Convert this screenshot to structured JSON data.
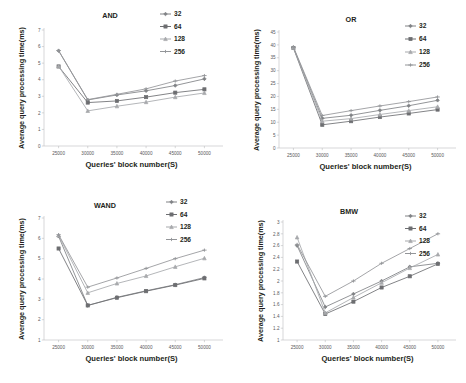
{
  "figure": {
    "background": "#ffffff",
    "panels": [
      "AND",
      "OR",
      "WAND",
      "BMW"
    ]
  },
  "common": {
    "xlabel": "Queries' block number(S)",
    "ylabel": "Average query processing time(ms)",
    "categories": [
      25000,
      30000,
      35000,
      40000,
      45000,
      50000
    ],
    "xtick_labels": [
      "25000",
      "30000",
      "35000",
      "40000",
      "45000",
      "50000"
    ],
    "legend_entries": [
      "32",
      "64",
      "128",
      "256"
    ],
    "series_colors": [
      "#808285",
      "#6d6e71",
      "#a7a9ac",
      "#939598"
    ],
    "markers": [
      "diamond",
      "square",
      "triangle",
      "cross"
    ]
  },
  "chart_data": [
    {
      "type": "line",
      "title": "AND",
      "xlabel": "Queries' block number(S)",
      "ylabel": "Average query processing time(ms)",
      "x": [
        25000,
        30000,
        35000,
        40000,
        45000,
        50000
      ],
      "xtick_labels": [
        "25000",
        "30000",
        "35000",
        "40000",
        "45000",
        "50000"
      ],
      "ytick_labels": [
        "0",
        "1",
        "2",
        "3",
        "4",
        "5",
        "6",
        "7"
      ],
      "ylim": [
        0,
        7
      ],
      "xlim": [
        22500,
        52500
      ],
      "grid": false,
      "legend_position": "top-right",
      "series": [
        {
          "name": "32",
          "values": [
            5.75,
            2.78,
            3.08,
            3.33,
            3.65,
            4.05
          ]
        },
        {
          "name": "64",
          "values": [
            4.8,
            2.62,
            2.72,
            2.95,
            3.22,
            3.42
          ]
        },
        {
          "name": "128",
          "values": [
            4.82,
            2.12,
            2.4,
            2.65,
            2.95,
            3.2
          ]
        },
        {
          "name": "256",
          "values": [
            5.76,
            2.8,
            3.12,
            3.45,
            3.92,
            4.25
          ]
        }
      ]
    },
    {
      "type": "line",
      "title": "OR",
      "xlabel": "Queries' block number(S)",
      "ylabel": "Average query processing time(ms)",
      "x": [
        25000,
        30000,
        35000,
        40000,
        45000,
        50000
      ],
      "xtick_labels": [
        "25000",
        "30000",
        "35000",
        "40000",
        "45000",
        "50000"
      ],
      "ytick_labels": [
        "0",
        "5",
        "10",
        "15",
        "20",
        "25",
        "30",
        "35",
        "40",
        "45"
      ],
      "ylim": [
        0,
        45
      ],
      "xlim": [
        22500,
        52500
      ],
      "grid": false,
      "legend_position": "top-right",
      "series": [
        {
          "name": "32",
          "values": [
            39.0,
            11.5,
            12.7,
            14.6,
            16.4,
            18.5
          ]
        },
        {
          "name": "64",
          "values": [
            38.8,
            9.0,
            10.4,
            12.0,
            13.4,
            14.9
          ]
        },
        {
          "name": "128",
          "values": [
            38.9,
            10.4,
            11.4,
            13.0,
            14.5,
            16.0
          ]
        },
        {
          "name": "256",
          "values": [
            39.2,
            12.6,
            14.5,
            16.3,
            18.0,
            19.8
          ]
        }
      ]
    },
    {
      "type": "line",
      "title": "WAND",
      "xlabel": "Queries' block number(S)",
      "ylabel": "Average query processing time(ms)",
      "x": [
        25000,
        30000,
        35000,
        40000,
        45000,
        50000
      ],
      "xtick_labels": [
        "25000",
        "30000",
        "35000",
        "40000",
        "45000",
        "50000"
      ],
      "ytick_labels": [
        "1",
        "2",
        "3",
        "4",
        "5",
        "6",
        "7"
      ],
      "ylim": [
        1,
        7
      ],
      "xlim": [
        22500,
        52500
      ],
      "grid": false,
      "legend_position": "top-right",
      "series": [
        {
          "name": "32",
          "values": [
            6.1,
            2.7,
            3.1,
            3.42,
            3.72,
            4.07
          ]
        },
        {
          "name": "64",
          "values": [
            5.5,
            2.7,
            3.08,
            3.4,
            3.7,
            4.03
          ]
        },
        {
          "name": "128",
          "values": [
            6.15,
            3.32,
            3.78,
            4.15,
            4.6,
            5.02
          ]
        },
        {
          "name": "256",
          "values": [
            6.18,
            3.6,
            4.05,
            4.52,
            5.0,
            5.42
          ]
        }
      ]
    },
    {
      "type": "line",
      "title": "BMW",
      "xlabel": "Queries' block number(S)",
      "ylabel": "Average query processing time(ms)",
      "x": [
        25000,
        30000,
        35000,
        40000,
        45000,
        50000
      ],
      "xtick_labels": [
        "25000",
        "30000",
        "35000",
        "40000",
        "45000",
        "50000"
      ],
      "ytick_labels": [
        "1",
        "1.2",
        "1.4",
        "1.6",
        "1.8",
        "2",
        "2.2",
        "2.4",
        "2.6",
        "2.8",
        "3"
      ],
      "ylim": [
        1,
        3
      ],
      "xlim": [
        22500,
        52500
      ],
      "grid": false,
      "legend_position": "top-right",
      "series": [
        {
          "name": "32",
          "values": [
            2.6,
            1.56,
            1.78,
            2.0,
            2.24,
            2.3
          ]
        },
        {
          "name": "64",
          "values": [
            2.33,
            1.44,
            1.65,
            1.89,
            2.08,
            2.29
          ]
        },
        {
          "name": "128",
          "values": [
            2.74,
            1.46,
            1.72,
            1.97,
            2.22,
            2.45
          ]
        },
        {
          "name": "256",
          "values": [
            2.62,
            1.74,
            2.0,
            2.3,
            2.55,
            2.8
          ]
        }
      ]
    }
  ]
}
